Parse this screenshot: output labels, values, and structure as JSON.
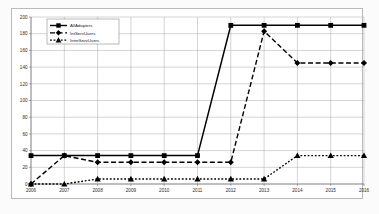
{
  "chart_data": {
    "type": "line",
    "title": "",
    "xlabel": "",
    "ylabel": "",
    "categories": [
      "2006",
      "2007",
      "2008",
      "2009",
      "2010",
      "2011",
      "2012",
      "2013",
      "2014",
      "2015",
      "2016"
    ],
    "x": [
      2006,
      2007,
      2008,
      2009,
      2010,
      2011,
      2012,
      2013,
      2014,
      2015,
      2016
    ],
    "ylim": [
      0,
      200
    ],
    "xlim": [
      2006,
      2016
    ],
    "ytick_labels": [
      "0",
      "20",
      "40",
      "60",
      "80",
      "100",
      "120",
      "140",
      "160",
      "180",
      "200"
    ],
    "yticks": [
      0,
      20,
      40,
      60,
      80,
      100,
      120,
      140,
      160,
      180,
      200
    ],
    "grid": true,
    "grid_color": "#a8a8a8",
    "legend_position": "top-left",
    "series": [
      {
        "name": "AllAdopters",
        "values": [
          34,
          34,
          34,
          34,
          34,
          34,
          190,
          190,
          190,
          190,
          190
        ],
        "line_style": "solid",
        "marker": "square",
        "color": "#000000"
      },
      {
        "name": "IntServUsers",
        "values": [
          0,
          34,
          26,
          26,
          26,
          26,
          26,
          183,
          145,
          145,
          145
        ],
        "line_style": "dashed",
        "marker": "diamond",
        "color": "#000000"
      },
      {
        "name": "InterServUsers",
        "values": [
          0,
          0,
          6,
          6,
          6,
          6,
          6,
          6,
          34,
          34,
          34
        ],
        "line_style": "dotted",
        "marker": "triangle",
        "color": "#000000"
      }
    ]
  }
}
